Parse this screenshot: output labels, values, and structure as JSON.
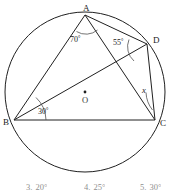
{
  "figure": {
    "type": "circle-geometry-diagram",
    "circle": {
      "center_label": "O",
      "cx": 85,
      "cy": 92,
      "r": 80
    },
    "vertices": [
      {
        "label": "A",
        "x": 85,
        "y": 15,
        "label_x": 83,
        "label_y": 11
      },
      {
        "label": "D",
        "x": 147,
        "y": 44,
        "label_x": 153,
        "label_y": 43
      },
      {
        "label": "C",
        "x": 155,
        "y": 120,
        "label_x": 160,
        "label_y": 126
      },
      {
        "label": "B",
        "x": 14,
        "y": 120,
        "label_x": 3,
        "label_y": 125
      }
    ],
    "chords": [
      {
        "name": "chord-ab",
        "x1": 85,
        "y1": 15,
        "x2": 14,
        "y2": 120
      },
      {
        "name": "chord-ac",
        "x1": 85,
        "y1": 15,
        "x2": 155,
        "y2": 120
      },
      {
        "name": "chord-ad",
        "x1": 85,
        "y1": 15,
        "x2": 147,
        "y2": 44
      },
      {
        "name": "chord-bc",
        "x1": 14,
        "y1": 120,
        "x2": 155,
        "y2": 120
      },
      {
        "name": "chord-bd",
        "x1": 14,
        "y1": 120,
        "x2": 147,
        "y2": 44
      },
      {
        "name": "chord-dc",
        "x1": 147,
        "y1": 44,
        "x2": 155,
        "y2": 120
      }
    ],
    "angles": [
      {
        "name": "angle-at-a",
        "value": "70",
        "unit": "°",
        "text_x": 70,
        "text_y": 42,
        "vertex": "A"
      },
      {
        "name": "angle-at-d",
        "value": "55",
        "unit": "°",
        "text_x": 113,
        "text_y": 45,
        "vertex": "D"
      },
      {
        "name": "angle-at-b",
        "value": "30",
        "unit": "°",
        "text_x": 38,
        "text_y": 114,
        "vertex": "B"
      },
      {
        "name": "angle-at-c",
        "value": "x",
        "unit": "",
        "text_x": 142,
        "text_y": 93,
        "vertex": "C"
      }
    ]
  },
  "choices": {
    "items": [
      {
        "number": "3.",
        "value": "20°"
      },
      {
        "number": "4.",
        "value": "25°"
      },
      {
        "number": "5.",
        "value": "30°"
      }
    ]
  },
  "colors": {
    "stroke": "#202020",
    "arc": "#505050",
    "text": "#1a1a1a",
    "muted_text": "#8f8f8f",
    "background": "#ffffff"
  }
}
